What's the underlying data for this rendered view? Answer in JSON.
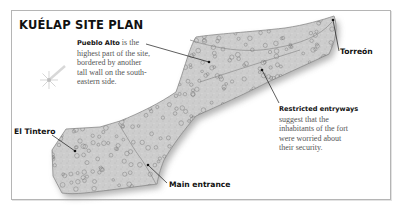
{
  "title": "KUÉLAP SITE PLAN",
  "compass": {
    "icon": "compass-rose-icon"
  },
  "annotations": {
    "pueblo_alto": {
      "heading": "Pueblo Alto",
      "lines": [
        "is the",
        "highest part of the site,",
        "bordered by another",
        "tall wall on the south-",
        "eastern side."
      ]
    },
    "restricted": {
      "heading": "Restricted entryways",
      "lines": [
        "suggest that the",
        "inhabitants of the fort",
        "were worried about",
        "their security."
      ]
    }
  },
  "labels": {
    "torreon": "Torreón",
    "el_tintero": "El Tintero",
    "main_entrance": "Main entrance"
  },
  "colors": {
    "site_fill": "#cfcfcf",
    "site_edge": "#8a8a8a",
    "shadow": "#a9a9a9",
    "house_ring": "#7c7c7c",
    "leader": "#1a1a1a"
  }
}
